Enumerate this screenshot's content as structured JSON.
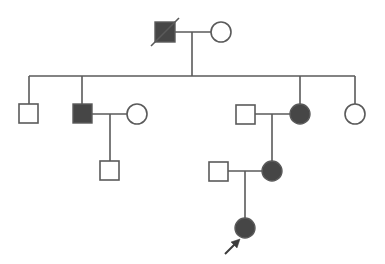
{
  "diagram": {
    "type": "pedigree",
    "colors": {
      "line": "#5a5a5a",
      "affected_fill": "#464646",
      "unaffected_fill": "#ffffff",
      "background": "#ffffff"
    },
    "generations": [
      {
        "label": "I",
        "individuals": [
          {
            "id": "I-1",
            "sex": "male",
            "affected": true,
            "deceased": true
          },
          {
            "id": "I-2",
            "sex": "female",
            "affected": false
          }
        ]
      },
      {
        "label": "II",
        "individuals": [
          {
            "id": "II-1",
            "sex": "male",
            "affected": false
          },
          {
            "id": "II-2",
            "sex": "male",
            "affected": true
          },
          {
            "id": "II-2-spouse",
            "sex": "female",
            "affected": false
          },
          {
            "id": "II-3-spouse",
            "sex": "male",
            "affected": false
          },
          {
            "id": "II-3",
            "sex": "female",
            "affected": true
          },
          {
            "id": "II-4",
            "sex": "female",
            "affected": false
          }
        ]
      },
      {
        "label": "III",
        "individuals": [
          {
            "id": "III-1",
            "sex": "male",
            "affected": false
          },
          {
            "id": "III-2-spouse",
            "sex": "male",
            "affected": false
          },
          {
            "id": "III-2",
            "sex": "female",
            "affected": true
          }
        ]
      },
      {
        "label": "IV",
        "individuals": [
          {
            "id": "IV-1",
            "sex": "female",
            "affected": true,
            "proband": true
          }
        ]
      }
    ],
    "proband_marker": "arrow"
  }
}
